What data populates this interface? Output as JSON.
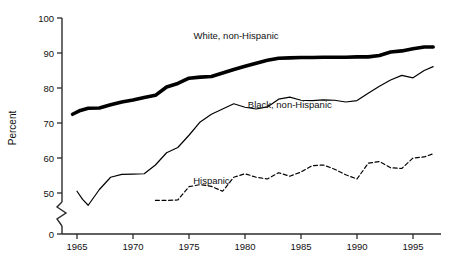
{
  "chart_data": {
    "type": "line",
    "title": "",
    "xlabel": "",
    "ylabel": "Percent",
    "xlim": [
      1964,
      1997
    ],
    "ylim": [
      45,
      100
    ],
    "axis_break": {
      "present": true,
      "from": 0,
      "to": 45,
      "style": "zigzag"
    },
    "grid": false,
    "legend_position": "inline-annotations",
    "x_ticks": [
      1965,
      1970,
      1975,
      1980,
      1985,
      1990,
      1995
    ],
    "x_tick_labels": [
      "1965",
      "1970",
      "1975",
      "1980",
      "1985",
      "1990",
      "1995"
    ],
    "y_ticks": [
      0,
      50,
      60,
      70,
      80,
      90,
      100
    ],
    "y_tick_labels": [
      "0",
      "50",
      "60",
      "70",
      "80",
      "90",
      "100"
    ],
    "series": [
      {
        "name": "White, non-Hispanic",
        "style": "solid-thick",
        "color": "#000000",
        "label_position": {
          "x": 1979.2,
          "y": 94.0
        },
        "x": [
          1964.6,
          1965.3,
          1966,
          1967,
          1968,
          1969,
          1970,
          1971,
          1972,
          1973,
          1974,
          1975,
          1976,
          1977,
          1978,
          1979,
          1980,
          1981,
          1982,
          1983,
          1984,
          1985,
          1986,
          1987,
          1988,
          1989,
          1990,
          1991,
          1992,
          1993,
          1994,
          1995,
          1996,
          1996.8
        ],
        "values": [
          72.5,
          73.6,
          74.2,
          74.3,
          75.2,
          76.0,
          76.6,
          77.3,
          77.9,
          80.3,
          81.3,
          82.8,
          83.1,
          83.3,
          84.3,
          85.3,
          86.2,
          87.1,
          87.9,
          88.5,
          88.6,
          88.7,
          88.7,
          88.8,
          88.8,
          88.8,
          88.9,
          88.9,
          89.3,
          90.3,
          90.6,
          91.2,
          91.7,
          91.7
        ]
      },
      {
        "name": "Black, non-Hispanic",
        "style": "solid-thin",
        "color": "#000000",
        "label_position": {
          "x": 1984.0,
          "y": 74.4
        },
        "x": [
          1965,
          1965.5,
          1966,
          1967,
          1968,
          1969,
          1970,
          1971,
          1972,
          1973,
          1974,
          1975,
          1976,
          1977,
          1978,
          1979,
          1980,
          1981,
          1982,
          1983,
          1984,
          1985,
          1986,
          1987,
          1988,
          1989,
          1990,
          1991,
          1992,
          1993,
          1994,
          1995,
          1996,
          1996.8
        ],
        "values": [
          50.5,
          48.2,
          46.5,
          51.0,
          54.5,
          55.3,
          55.4,
          55.5,
          58.0,
          61.5,
          63.0,
          66.5,
          70.3,
          72.5,
          74.0,
          75.5,
          74.5,
          74.0,
          74.6,
          76.8,
          77.4,
          76.5,
          76.4,
          76.6,
          76.5,
          76.0,
          76.4,
          78.5,
          80.5,
          82.3,
          83.6,
          82.9,
          85.0,
          86.1
        ]
      },
      {
        "name": "Hispanic",
        "style": "dashed",
        "color": "#000000",
        "label_position": {
          "x": 1977.0,
          "y": 52.6
        },
        "x": [
          1972,
          1973,
          1974,
          1975,
          1976,
          1977,
          1978,
          1979,
          1980,
          1981,
          1982,
          1983,
          1984,
          1985,
          1986,
          1987,
          1988,
          1989,
          1990,
          1991,
          1992,
          1993,
          1994,
          1995,
          1996,
          1996.8
        ],
        "values": [
          47.9,
          47.9,
          48.0,
          51.8,
          52.4,
          51.9,
          50.5,
          54.5,
          55.5,
          54.5,
          54.0,
          55.8,
          54.8,
          56.0,
          57.8,
          58.0,
          56.8,
          55.2,
          54.0,
          58.5,
          59.0,
          57.2,
          57.0,
          60.0,
          60.3,
          61.2
        ]
      }
    ]
  }
}
